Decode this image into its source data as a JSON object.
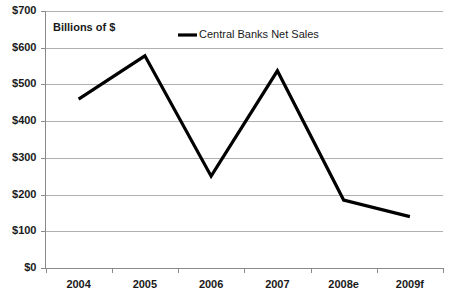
{
  "chart_data": {
    "type": "line",
    "title": "",
    "subtitle": "",
    "axis_note": "Billions of $",
    "xlabel": "",
    "ylabel": "",
    "categories": [
      "2004",
      "2005",
      "2006",
      "2007",
      "2008e",
      "2009f"
    ],
    "series": [
      {
        "name": "Central Banks Net Sales",
        "color": "#000000",
        "values": [
          460,
          578,
          250,
          537,
          185,
          140
        ]
      }
    ],
    "ylim": [
      0,
      700
    ],
    "ytick_values": [
      0,
      100,
      200,
      300,
      400,
      500,
      600,
      700
    ],
    "ytick_labels": [
      "$0",
      "$100",
      "$200",
      "$300",
      "$400",
      "$500",
      "$600",
      "$700"
    ],
    "grid": true,
    "grid_axis": "y",
    "legend_position": "top-center",
    "legend_entries": [
      "Central Banks Net Sales"
    ],
    "units": "Billions of $",
    "colors": {
      "background": "#ffffff",
      "gridline": "#b0b0b0",
      "axis": "#8a8a8a",
      "text": "#1a1a1a",
      "series": "#000000"
    }
  },
  "legend": {
    "items": [
      {
        "label": "Central Banks Net Sales"
      }
    ]
  }
}
